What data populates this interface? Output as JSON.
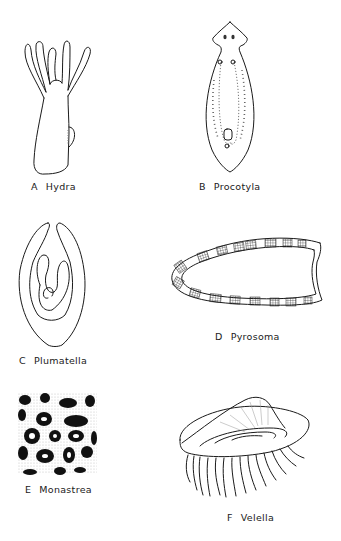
{
  "plate": {
    "figures": [
      {
        "letter": "A",
        "name": "Hydra",
        "icon": "hydra-illustration"
      },
      {
        "letter": "B",
        "name": "Procotyla",
        "icon": "flatworm-illustration"
      },
      {
        "letter": "C",
        "name": "Plumatella",
        "icon": "bryozoan-illustration"
      },
      {
        "letter": "D",
        "name": "Pyrosoma",
        "icon": "tunicate-colony-illustration"
      },
      {
        "letter": "E",
        "name": "Monastrea",
        "icon": "coral-illustration"
      },
      {
        "letter": "F",
        "name": "Velella",
        "icon": "by-the-wind-sailor-illustration"
      }
    ],
    "colors": {
      "ink": "#1a1a1a",
      "background": "#ffffff"
    }
  }
}
